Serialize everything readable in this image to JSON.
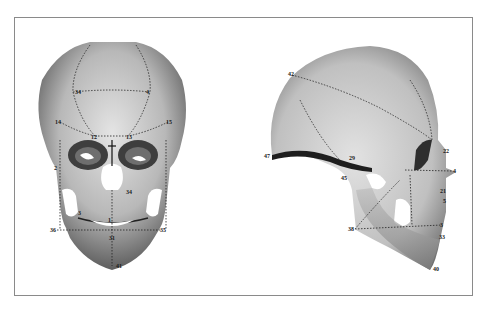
{
  "figure": {
    "views": [
      {
        "name": "frontal",
        "landmarks": [
          {
            "id": "34",
            "x": 73,
            "y": 92
          },
          {
            "id": "4",
            "x": 150,
            "y": 92
          },
          {
            "id": "14",
            "x": 60,
            "y": 122
          },
          {
            "id": "15",
            "x": 168,
            "y": 122
          },
          {
            "id": "12",
            "x": 95,
            "y": 136
          },
          {
            "id": "13",
            "x": 128,
            "y": 136
          },
          {
            "id": "2",
            "x": 58,
            "y": 168
          },
          {
            "id": "34b",
            "x": 130,
            "y": 192
          },
          {
            "id": "3",
            "x": 80,
            "y": 213
          },
          {
            "id": "1",
            "x": 108,
            "y": 225
          },
          {
            "id": "36",
            "x": 57,
            "y": 230
          },
          {
            "id": "35",
            "x": 162,
            "y": 230
          },
          {
            "id": "31",
            "x": 112,
            "y": 238
          },
          {
            "id": "41",
            "x": 113,
            "y": 266
          }
        ]
      },
      {
        "name": "lateral",
        "landmarks": [
          {
            "id": "42",
            "x": 292,
            "y": 75
          },
          {
            "id": "47",
            "x": 272,
            "y": 156
          },
          {
            "id": "29",
            "x": 352,
            "y": 160
          },
          {
            "id": "45",
            "x": 347,
            "y": 170
          },
          {
            "id": "22",
            "x": 444,
            "y": 151
          },
          {
            "id": "4",
            "x": 452,
            "y": 171
          },
          {
            "id": "21",
            "x": 443,
            "y": 190
          },
          {
            "id": "5",
            "x": 445,
            "y": 200
          },
          {
            "id": "38",
            "x": 355,
            "y": 229
          },
          {
            "id": "3",
            "x": 442,
            "y": 225
          },
          {
            "id": "33",
            "x": 443,
            "y": 236
          },
          {
            "id": "40",
            "x": 430,
            "y": 269
          }
        ]
      }
    ],
    "colors": {
      "frame": "#8a8a8a",
      "bone_light": "#d8d8d8",
      "bone_mid": "#a8a8a8",
      "bone_dark": "#5a5a5a",
      "marks": "#1a1a1a"
    }
  }
}
